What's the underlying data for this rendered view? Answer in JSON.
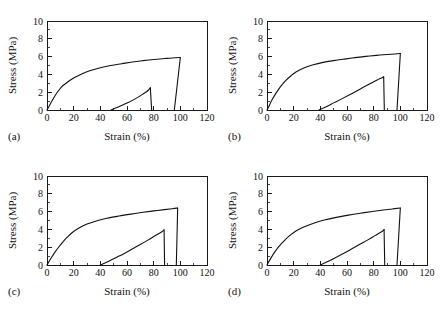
{
  "figure": {
    "background": "#ffffff",
    "line_color": "#111111",
    "panel_count": 4
  },
  "axes": {
    "xlabel": "Strain (%)",
    "ylabel": "Stress (MPa)",
    "xticks": [
      "0",
      "20",
      "40",
      "60",
      "80",
      "100",
      "120"
    ],
    "yticks": [
      "0",
      "2",
      "4",
      "6",
      "8",
      "10"
    ],
    "xlim": [
      0,
      120
    ],
    "ylim": [
      0,
      10
    ],
    "xtick_values": [
      0,
      20,
      40,
      60,
      80,
      100,
      120
    ],
    "ytick_values": [
      0,
      2,
      4,
      6,
      8,
      10
    ],
    "minor_x_step": 10,
    "minor_y_step": 1,
    "tick_direction": "in",
    "grid": false
  },
  "panels": {
    "a": {
      "tag": "(a)"
    },
    "b": {
      "tag": "(b)"
    },
    "c": {
      "tag": "(c)"
    },
    "d": {
      "tag": "(d)"
    }
  },
  "chart_data": [
    {
      "type": "line",
      "panel": "(a)",
      "title": "",
      "xlabel": "Strain (%)",
      "ylabel": "Stress (MPa)",
      "xlim": [
        0,
        120
      ],
      "ylim": [
        0,
        10
      ],
      "grid": false,
      "legend": "none",
      "series": [
        {
          "name": "first-loading-curve",
          "points": [
            [
              0,
              0
            ],
            [
              2,
              0.55
            ],
            [
              4,
              1.1
            ],
            [
              6,
              1.6
            ],
            [
              9,
              2.25
            ],
            [
              12,
              2.75
            ],
            [
              16,
              3.2
            ],
            [
              20,
              3.6
            ],
            [
              26,
              4.05
            ],
            [
              32,
              4.4
            ],
            [
              40,
              4.75
            ],
            [
              48,
              5.0
            ],
            [
              56,
              5.2
            ],
            [
              64,
              5.4
            ],
            [
              72,
              5.55
            ],
            [
              80,
              5.68
            ],
            [
              88,
              5.78
            ],
            [
              94,
              5.85
            ],
            [
              100,
              5.9
            ]
          ]
        },
        {
          "name": "first-unloading-drop",
          "points": [
            [
              100,
              5.9
            ],
            [
              95.5,
              0
            ]
          ]
        },
        {
          "name": "second-loading-curve",
          "points": [
            [
              48,
              0
            ],
            [
              52,
              0.25
            ],
            [
              56,
              0.5
            ],
            [
              60,
              0.78
            ],
            [
              64,
              1.08
            ],
            [
              68,
              1.42
            ],
            [
              71,
              1.7
            ],
            [
              74,
              2.0
            ],
            [
              76,
              2.22
            ],
            [
              77.5,
              2.5
            ]
          ]
        },
        {
          "name": "second-unloading-drop",
          "points": [
            [
              77.5,
              2.5
            ],
            [
              78.5,
              0
            ]
          ]
        }
      ]
    },
    {
      "type": "line",
      "panel": "(b)",
      "title": "",
      "xlabel": "Strain (%)",
      "ylabel": "Stress (MPa)",
      "xlim": [
        0,
        120
      ],
      "ylim": [
        0,
        10
      ],
      "grid": false,
      "legend": "none",
      "series": [
        {
          "name": "first-loading-curve",
          "points": [
            [
              0,
              0
            ],
            [
              2,
              0.6
            ],
            [
              4,
              1.2
            ],
            [
              7,
              1.95
            ],
            [
              10,
              2.6
            ],
            [
              14,
              3.3
            ],
            [
              18,
              3.85
            ],
            [
              22,
              4.3
            ],
            [
              28,
              4.75
            ],
            [
              34,
              5.05
            ],
            [
              42,
              5.35
            ],
            [
              50,
              5.55
            ],
            [
              58,
              5.72
            ],
            [
              66,
              5.88
            ],
            [
              74,
              6.02
            ],
            [
              82,
              6.14
            ],
            [
              90,
              6.24
            ],
            [
              96,
              6.3
            ],
            [
              100,
              6.35
            ]
          ]
        },
        {
          "name": "first-unloading-drop",
          "points": [
            [
              100,
              6.35
            ],
            [
              97.5,
              0
            ]
          ]
        },
        {
          "name": "second-loading-curve",
          "points": [
            [
              39,
              0
            ],
            [
              44,
              0.35
            ],
            [
              50,
              0.8
            ],
            [
              56,
              1.25
            ],
            [
              62,
              1.72
            ],
            [
              68,
              2.2
            ],
            [
              74,
              2.7
            ],
            [
              79,
              3.1
            ],
            [
              83,
              3.4
            ],
            [
              86,
              3.6
            ],
            [
              87.5,
              3.72
            ]
          ]
        },
        {
          "name": "second-unloading-drop",
          "points": [
            [
              87.5,
              3.72
            ],
            [
              88,
              0
            ]
          ]
        }
      ]
    },
    {
      "type": "line",
      "panel": "(c)",
      "title": "",
      "xlabel": "Strain (%)",
      "ylabel": "Stress (MPa)",
      "xlim": [
        0,
        120
      ],
      "ylim": [
        0,
        10
      ],
      "grid": false,
      "legend": "none",
      "series": [
        {
          "name": "first-loading-curve",
          "points": [
            [
              0,
              0
            ],
            [
              3,
              0.75
            ],
            [
              6,
              1.45
            ],
            [
              9,
              2.05
            ],
            [
              12,
              2.6
            ],
            [
              15,
              3.1
            ],
            [
              19,
              3.65
            ],
            [
              24,
              4.15
            ],
            [
              30,
              4.6
            ],
            [
              37,
              4.95
            ],
            [
              45,
              5.25
            ],
            [
              54,
              5.5
            ],
            [
              63,
              5.72
            ],
            [
              72,
              5.92
            ],
            [
              80,
              6.08
            ],
            [
              88,
              6.22
            ],
            [
              94,
              6.32
            ],
            [
              98,
              6.4
            ]
          ]
        },
        {
          "name": "first-unloading-drop",
          "points": [
            [
              98,
              6.4
            ],
            [
              97,
              0
            ]
          ]
        },
        {
          "name": "second-loading-curve",
          "points": [
            [
              40,
              0
            ],
            [
              46,
              0.4
            ],
            [
              52,
              0.85
            ],
            [
              58,
              1.3
            ],
            [
              64,
              1.8
            ],
            [
              70,
              2.3
            ],
            [
              76,
              2.82
            ],
            [
              81,
              3.28
            ],
            [
              85,
              3.62
            ],
            [
              87,
              3.82
            ],
            [
              87.8,
              3.95
            ]
          ]
        },
        {
          "name": "second-unloading-drop",
          "points": [
            [
              87.8,
              3.95
            ],
            [
              88.2,
              0
            ]
          ]
        }
      ]
    },
    {
      "type": "line",
      "panel": "(d)",
      "title": "",
      "xlabel": "Strain (%)",
      "ylabel": "Stress (MPa)",
      "xlim": [
        0,
        120
      ],
      "ylim": [
        0,
        10
      ],
      "grid": false,
      "legend": "none",
      "series": [
        {
          "name": "first-loading-curve",
          "points": [
            [
              0,
              0
            ],
            [
              3,
              0.8
            ],
            [
              6,
              1.5
            ],
            [
              9,
              2.1
            ],
            [
              13,
              2.75
            ],
            [
              17,
              3.3
            ],
            [
              22,
              3.85
            ],
            [
              28,
              4.3
            ],
            [
              35,
              4.7
            ],
            [
              43,
              5.05
            ],
            [
              52,
              5.35
            ],
            [
              61,
              5.6
            ],
            [
              70,
              5.82
            ],
            [
              79,
              6.02
            ],
            [
              87,
              6.18
            ],
            [
              94,
              6.3
            ],
            [
              100,
              6.4
            ]
          ]
        },
        {
          "name": "first-unloading-drop",
          "points": [
            [
              100,
              6.4
            ],
            [
              97.5,
              0
            ]
          ]
        },
        {
          "name": "second-loading-curve",
          "points": [
            [
              40,
              0
            ],
            [
              46,
              0.42
            ],
            [
              52,
              0.88
            ],
            [
              58,
              1.35
            ],
            [
              64,
              1.85
            ],
            [
              70,
              2.35
            ],
            [
              76,
              2.85
            ],
            [
              81,
              3.3
            ],
            [
              85,
              3.65
            ],
            [
              87,
              3.85
            ],
            [
              87.8,
              3.98
            ]
          ]
        },
        {
          "name": "second-unloading-drop",
          "points": [
            [
              87.8,
              3.98
            ],
            [
              88.3,
              0
            ]
          ]
        }
      ]
    }
  ]
}
